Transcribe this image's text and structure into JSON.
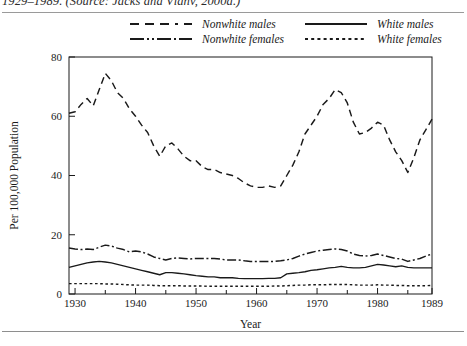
{
  "caption": {
    "text": "1929–1989. (Source: Jacks and Vlahv, 2000a.)"
  },
  "legend": {
    "items": [
      {
        "label": "Nonwhite males",
        "style": "dashed",
        "key": "nonwhite-males-key"
      },
      {
        "label": "Nonwhite females",
        "style": "dashdot",
        "key": "nonwhite-females-key"
      },
      {
        "label": "White males",
        "style": "solid",
        "key": "white-males-key"
      },
      {
        "label": "White females",
        "style": "dotted",
        "key": "white-females-key"
      }
    ]
  },
  "chart_data": {
    "type": "line",
    "title": "",
    "xlabel": "Year",
    "ylabel": "Per 100,000 Population",
    "xlim": [
      1929,
      1989
    ],
    "ylim": [
      0,
      80
    ],
    "yticks": [
      0,
      20,
      40,
      60,
      80
    ],
    "xticks": [
      1930,
      1940,
      1950,
      1960,
      1970,
      1980,
      1989
    ],
    "xtick_labels": [
      "1930",
      "1940",
      "1950",
      "1960",
      "1970",
      "1980",
      "1989"
    ],
    "ytick_labels": [
      "0",
      "20",
      "40",
      "60",
      "80"
    ],
    "minor_xticks": [
      1935,
      1945,
      1955,
      1965,
      1975,
      1985
    ],
    "grid": false,
    "legend_position": "above-plot",
    "x": [
      1929,
      1930,
      1931,
      1932,
      1933,
      1934,
      1935,
      1936,
      1937,
      1938,
      1939,
      1940,
      1941,
      1942,
      1943,
      1944,
      1945,
      1946,
      1947,
      1948,
      1949,
      1950,
      1951,
      1952,
      1953,
      1954,
      1955,
      1956,
      1957,
      1958,
      1959,
      1960,
      1961,
      1962,
      1963,
      1964,
      1965,
      1966,
      1967,
      1968,
      1969,
      1970,
      1971,
      1972,
      1973,
      1974,
      1975,
      1976,
      1977,
      1978,
      1979,
      1980,
      1981,
      1982,
      1983,
      1984,
      1985,
      1986,
      1987,
      1988,
      1989
    ],
    "series": [
      {
        "name": "Nonwhite males",
        "style": "dashed",
        "values": [
          61,
          61.5,
          64,
          66,
          63.5,
          69,
          74.5,
          72,
          68,
          66,
          62.5,
          60,
          57,
          54.5,
          50,
          46.5,
          50,
          51,
          49,
          46.5,
          45,
          45,
          43,
          42,
          42,
          41,
          40.5,
          40,
          39,
          37.5,
          36.5,
          36,
          36,
          36.5,
          36,
          36.5,
          40,
          43.5,
          48,
          54,
          57,
          60,
          64,
          66,
          69,
          68,
          64.5,
          58,
          54,
          54.5,
          56,
          58,
          57,
          52,
          48,
          45,
          41,
          46,
          52,
          55.5,
          59
        ]
      },
      {
        "name": "Nonwhite females",
        "style": "dashdot",
        "values": [
          15.5,
          15.2,
          15,
          15.2,
          15,
          15.8,
          16.5,
          16.2,
          15.5,
          15,
          14.2,
          14.5,
          14.2,
          13.5,
          12.5,
          12,
          11.5,
          12,
          12.2,
          12,
          11.8,
          12,
          12,
          12,
          12,
          11.8,
          11.5,
          11.5,
          11.5,
          11.2,
          11,
          11,
          11,
          11,
          11,
          11.2,
          11.5,
          12,
          12.8,
          13.5,
          14,
          14.5,
          14.8,
          15,
          15.2,
          15,
          14.5,
          13.5,
          13,
          12.8,
          13,
          13.5,
          13,
          12.5,
          12,
          11.8,
          11,
          11.5,
          12,
          12.8,
          13.5
        ]
      },
      {
        "name": "White males",
        "style": "solid",
        "values": [
          9,
          9.5,
          10,
          10.5,
          10.8,
          11,
          10.8,
          10.5,
          10,
          9.5,
          9,
          8.5,
          8,
          7.5,
          7,
          6.5,
          7.2,
          7.2,
          7,
          6.8,
          6.5,
          6.2,
          6,
          5.8,
          5.8,
          5.5,
          5.5,
          5.5,
          5.3,
          5.2,
          5.2,
          5.2,
          5.2,
          5.3,
          5.3,
          5.5,
          6.8,
          7,
          7.2,
          7.5,
          8,
          8.2,
          8.5,
          8.8,
          9,
          9.3,
          9,
          8.8,
          8.8,
          9,
          9.5,
          10,
          9.8,
          9.5,
          9.2,
          9.5,
          9,
          8.8,
          8.8,
          8.8,
          8.8
        ]
      },
      {
        "name": "White females",
        "style": "dotted",
        "values": [
          3.5,
          3.5,
          3.5,
          3.5,
          3.5,
          3.5,
          3.4,
          3.4,
          3.3,
          3.2,
          3.1,
          3,
          3,
          3,
          2.9,
          2.8,
          2.8,
          2.8,
          2.8,
          2.7,
          2.7,
          2.7,
          2.7,
          2.6,
          2.6,
          2.6,
          2.6,
          2.6,
          2.6,
          2.6,
          2.6,
          2.6,
          2.6,
          2.6,
          2.7,
          2.7,
          2.8,
          2.9,
          3,
          3,
          3.1,
          3.1,
          3.1,
          3.2,
          3.2,
          3.2,
          3.2,
          3.1,
          3,
          3,
          3,
          3.1,
          3,
          3,
          2.9,
          2.9,
          2.8,
          2.8,
          2.8,
          2.8,
          2.9
        ]
      }
    ]
  },
  "colors": {
    "line": "#1a1a1a",
    "axis": "#1a1a1a",
    "background": "#ffffff",
    "rule": "#9a9a9a"
  }
}
